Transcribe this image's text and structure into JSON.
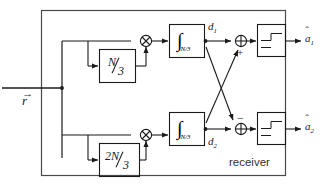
{
  "diagram": {
    "title": "receiver",
    "type": "block-diagram",
    "stroke_color": "#1a1a1a",
    "background": "#ffffff"
  },
  "input": {
    "label_base": "r",
    "label_accent": "→",
    "description": "received vector"
  },
  "branches": [
    {
      "id": "upper",
      "delay_block": {
        "numerator": "N",
        "denominator": "3"
      },
      "multiplier_symbol": "⊗",
      "integrator": {
        "glyph": "∫",
        "range": "N/3"
      },
      "decision_variable": {
        "base": "d",
        "subscript": "1"
      },
      "adder_symbol": "⊕",
      "adder_sign": "+",
      "threshold_block": "threshold-detector",
      "output": {
        "base": "a",
        "subscript": "1",
        "accent": "ˆ"
      }
    },
    {
      "id": "lower",
      "delay_block": {
        "numerator": "2N",
        "denominator": "3"
      },
      "multiplier_symbol": "⊗",
      "integrator": {
        "glyph": "∫",
        "range": "N/3"
      },
      "decision_variable": {
        "base": "d",
        "subscript": "2"
      },
      "adder_symbol": "⊕",
      "adder_sign": "−",
      "threshold_block": "threshold-detector",
      "output": {
        "base": "a",
        "subscript": "2",
        "accent": "ˆ"
      }
    }
  ]
}
